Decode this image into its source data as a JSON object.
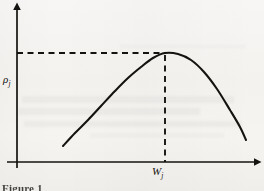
{
  "figure": {
    "caption_fragment": "Figure 1",
    "background_color": "#f4f3f1",
    "ink_color": "#15130f"
  },
  "axes": {
    "y_label": "ρ",
    "y_label_subscript": "j",
    "x_label": "W",
    "x_label_subscript": "j",
    "y_axis_arrow": "arrow-up",
    "x_axis_arrow": "arrow-right"
  },
  "chart_data": {
    "type": "line",
    "title": "",
    "xlabel": "W_j",
    "ylabel": "rho_j",
    "grid": false,
    "legend": null,
    "axis_origin_px": [
      17,
      162
    ],
    "xlim_px": [
      17,
      260
    ],
    "ylim_px": [
      162,
      3
    ],
    "annotations": [
      {
        "name": "peak-horizontal-guide",
        "style": "dashed",
        "from_px": [
          17,
          53
        ],
        "to_px": [
          165,
          53
        ],
        "meaning": "maximum value of rho_j"
      },
      {
        "name": "peak-vertical-guide",
        "style": "dashed",
        "from_px": [
          165,
          55
        ],
        "to_px": [
          165,
          162
        ],
        "meaning": "optimal W_j at the maximum"
      }
    ],
    "series": [
      {
        "name": "rho_j as a function of W_j",
        "style": "solid",
        "shape": "concave-down-unimodal",
        "points_px": [
          [
            63,
            146
          ],
          [
            75,
            133
          ],
          [
            88,
            120
          ],
          [
            101,
            106
          ],
          [
            115,
            91
          ],
          [
            128,
            78
          ],
          [
            141,
            67
          ],
          [
            153,
            58
          ],
          [
            165,
            53
          ],
          [
            178,
            54
          ],
          [
            191,
            60
          ],
          [
            204,
            72
          ],
          [
            217,
            89
          ],
          [
            230,
            110
          ],
          [
            240,
            127
          ],
          [
            246,
            140
          ]
        ],
        "peak_px": [
          165,
          53
        ]
      }
    ]
  }
}
